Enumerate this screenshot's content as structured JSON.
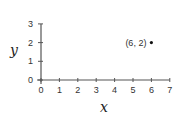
{
  "chart_data": {
    "type": "scatter",
    "title": "",
    "xlabel": "x",
    "ylabel": "y",
    "xlim": [
      0,
      7
    ],
    "ylim": [
      0,
      3
    ],
    "xticks": [
      0,
      1,
      2,
      3,
      4,
      5,
      6,
      7
    ],
    "yticks": [
      0,
      1,
      2,
      3
    ],
    "grid": false,
    "legend": null,
    "series": [
      {
        "name": "point",
        "points": [
          {
            "x": 6,
            "y": 2,
            "label": "(6, 2)"
          }
        ]
      }
    ],
    "annotations": [
      "(6, 2)"
    ]
  },
  "colors": {
    "axis": "#555555",
    "point": "#111111",
    "text": "#333333"
  },
  "layout": {
    "origin_px": [
      41,
      80
    ],
    "x_px_per_unit": 18.4,
    "y_px_per_unit": 18.7
  }
}
